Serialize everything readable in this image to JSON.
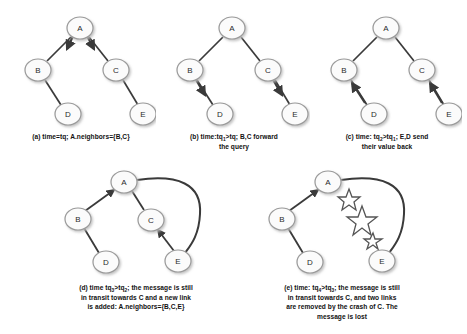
{
  "figure": {
    "type": "diagram",
    "background_color": "#ffffff",
    "node_fill": "#fbfbfb",
    "node_stroke": "#9a9a9a",
    "edge_color": "#3a3a3a",
    "star_stroke": "#555555"
  },
  "panels": [
    {
      "id": "a",
      "label": "(a)",
      "caption_lines": [
        "time=tq; A.neighbors={B,C}"
      ],
      "caption_plain": "(a) time=tq; A.neighbors={B,C}",
      "nodes": [
        {
          "id": "A",
          "label": "A",
          "cx": 74,
          "cy": 24
        },
        {
          "id": "B",
          "label": "B",
          "cx": 32,
          "cy": 66
        },
        {
          "id": "C",
          "label": "C",
          "cx": 110,
          "cy": 66
        },
        {
          "id": "D",
          "label": "D",
          "cx": 62,
          "cy": 110
        },
        {
          "id": "E",
          "label": "E",
          "cx": 137,
          "cy": 110
        }
      ],
      "edges": [
        {
          "from": "A",
          "to": "B",
          "arrow": "to-target-near-source"
        },
        {
          "from": "A",
          "to": "C",
          "arrow": "to-target-near-source"
        },
        {
          "from": "B",
          "to": "D",
          "arrow": "none"
        },
        {
          "from": "C",
          "to": "E",
          "arrow": "none"
        }
      ]
    },
    {
      "id": "b",
      "label": "(b)",
      "caption_lines": [
        "time:tq",
        "1",
        ">tq; B,C forward",
        "the query"
      ],
      "caption_plain": "(b) time:tq1>tq; B,C forward the query",
      "nodes": [
        {
          "id": "A",
          "label": "A",
          "cx": 74,
          "cy": 24
        },
        {
          "id": "B",
          "label": "B",
          "cx": 32,
          "cy": 66
        },
        {
          "id": "C",
          "label": "C",
          "cx": 110,
          "cy": 66
        },
        {
          "id": "D",
          "label": "D",
          "cx": 62,
          "cy": 110
        },
        {
          "id": "E",
          "label": "E",
          "cx": 137,
          "cy": 110
        }
      ],
      "edges": [
        {
          "from": "A",
          "to": "B",
          "arrow": "none"
        },
        {
          "from": "A",
          "to": "C",
          "arrow": "none"
        },
        {
          "from": "B",
          "to": "D",
          "arrow": "to-target-near-source"
        },
        {
          "from": "C",
          "to": "E",
          "arrow": "to-target-near-source"
        }
      ]
    },
    {
      "id": "c",
      "label": "(c)",
      "caption_lines": [
        "time: tq",
        "2",
        ">tq",
        "1",
        "; E,D send",
        "their value back"
      ],
      "caption_plain": "(c) time: tq2>tq1; E,D send their value back",
      "nodes": [
        {
          "id": "A",
          "label": "A",
          "cx": 74,
          "cy": 24
        },
        {
          "id": "B",
          "label": "B",
          "cx": 32,
          "cy": 66
        },
        {
          "id": "C",
          "label": "C",
          "cx": 110,
          "cy": 66
        },
        {
          "id": "D",
          "label": "D",
          "cx": 62,
          "cy": 110
        },
        {
          "id": "E",
          "label": "E",
          "cx": 137,
          "cy": 110
        }
      ],
      "edges": [
        {
          "from": "A",
          "to": "B",
          "arrow": "none"
        },
        {
          "from": "A",
          "to": "C",
          "arrow": "none"
        },
        {
          "from": "D",
          "to": "B",
          "arrow": "to-target"
        },
        {
          "from": "E",
          "to": "C",
          "arrow": "to-target"
        }
      ]
    },
    {
      "id": "d",
      "label": "(d)",
      "caption_lines": [
        "time tq",
        "3",
        ">tq",
        "2",
        "; the message is still",
        "in transit towards C and a new link",
        "is added: A.neighbors={B,C,E}"
      ],
      "caption_plain": "(d) time tq3>tq2; the message is still in transit towards C and a new link is added: A.neighbors={B,C,E}",
      "nodes": [
        {
          "id": "A",
          "label": "A",
          "cx": 86,
          "cy": 18
        },
        {
          "id": "B",
          "label": "B",
          "cx": 40,
          "cy": 55
        },
        {
          "id": "C",
          "label": "C",
          "cx": 113,
          "cy": 56
        },
        {
          "id": "D",
          "label": "D",
          "cx": 68,
          "cy": 98
        },
        {
          "id": "E",
          "label": "E",
          "cx": 140,
          "cy": 97
        }
      ],
      "edges": [
        {
          "from": "B",
          "to": "A",
          "arrow": "to-target"
        },
        {
          "from": "A",
          "to": "C",
          "arrow": "none"
        },
        {
          "from": "B",
          "to": "D",
          "arrow": "none"
        },
        {
          "from": "E",
          "to": "C",
          "arrow": "to-target"
        },
        {
          "from": "A",
          "to": "E",
          "arrow": "none",
          "style": "curved-new-link"
        }
      ]
    },
    {
      "id": "e",
      "label": "(e)",
      "caption_lines": [
        "time: tq",
        "4",
        ">tq",
        "3",
        "; the message is still",
        "in transit towards C, and two links",
        "are removed by the crash of C. The",
        "message is lost"
      ],
      "caption_plain": "(e) time: tq4>tq3; the message is still in transit towards C, and two links are removed by the crash of C. The message is lost",
      "nodes": [
        {
          "id": "A",
          "label": "A",
          "cx": 86,
          "cy": 18
        },
        {
          "id": "B",
          "label": "B",
          "cx": 40,
          "cy": 55
        },
        {
          "id": "D",
          "label": "D",
          "cx": 68,
          "cy": 98
        },
        {
          "id": "E",
          "label": "E",
          "cx": 140,
          "cy": 97
        }
      ],
      "edges": [
        {
          "from": "B",
          "to": "A",
          "arrow": "to-target"
        },
        {
          "from": "B",
          "to": "D",
          "arrow": "none"
        },
        {
          "from": "A",
          "to": "E",
          "arrow": "none",
          "style": "curved-new-link"
        }
      ],
      "crash_marker": {
        "node_removed": "C",
        "glyph": "explosion-stars",
        "stars": [
          {
            "cx": 107,
            "cy": 36,
            "r": 10
          },
          {
            "cx": 120,
            "cy": 56,
            "r": 13
          },
          {
            "cx": 131,
            "cy": 76,
            "r": 8
          }
        ]
      }
    }
  ]
}
